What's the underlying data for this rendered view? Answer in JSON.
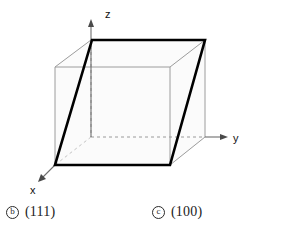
{
  "figure": {
    "axes": [
      {
        "name": "x-axis",
        "label": "x",
        "label_x": 33,
        "label_y": 186,
        "direction": "down-left"
      },
      {
        "name": "y-axis",
        "label": "y",
        "label_x": 228,
        "label_y": 141,
        "direction": "right"
      },
      {
        "name": "z-axis",
        "label": "z",
        "label_x": 105,
        "label_y": 14,
        "direction": "up"
      }
    ],
    "origin": {
      "x": 138,
      "y": 137
    },
    "cube_vertices": {
      "front_bottom_left": {
        "x": 55,
        "y": 165
      },
      "front_bottom_right": {
        "x": 170,
        "y": 165
      },
      "front_top_left": {
        "x": 55,
        "y": 67
      },
      "front_top_right": {
        "x": 170,
        "y": 67
      },
      "back_bottom_left": {
        "x": 91,
        "y": 137
      },
      "back_bottom_right": {
        "x": 205,
        "y": 137
      },
      "back_top_left": {
        "x": 91,
        "y": 40
      },
      "back_top_right": {
        "x": 205,
        "y": 40
      }
    },
    "highlighted_plane": {
      "name": "bold-plane",
      "vertices": "92,40 205,40 170,165 55,165",
      "stroke_color": "#000000",
      "stroke_width": 2.6,
      "fill": "none"
    },
    "cube_edge_color": "#8c8c8c",
    "hidden_edge_style": "dashed",
    "face_fill": "#fbfbfb",
    "axis_color": "#6e6e6e"
  },
  "captions": [
    {
      "marker": "b",
      "label": "(111)"
    },
    {
      "marker": "c",
      "label": "(100)"
    }
  ]
}
